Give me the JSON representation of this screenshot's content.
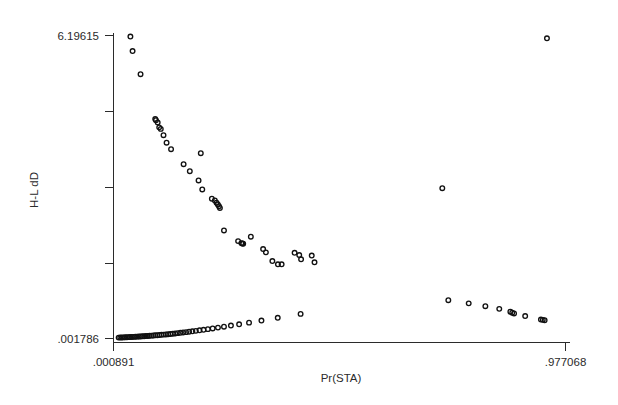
{
  "chart_data": {
    "type": "scatter",
    "title": "",
    "subtitle": "",
    "xlabel": "Pr(STA)",
    "ylabel": "H-L dD",
    "grid": false,
    "legend": false,
    "legend_position": "none",
    "marker_style": "open-circle",
    "marker_color": "#111111",
    "background_color": "#ffffff",
    "xlim": [
      0.000891,
      0.977068
    ],
    "ylim": [
      0.001786,
      6.19615
    ],
    "xticks": [
      0.000891,
      0.977068
    ],
    "xtick_labels": [
      ".000891",
      ".977068"
    ],
    "yticks": [
      0.001786,
      1.550627,
      3.099468,
      4.648309,
      6.19615
    ],
    "ytick_labels": [
      "",
      "",
      "",
      "",
      ""
    ],
    "ytick_labeled": {
      "top": "6.19615",
      "bottom": ".001786"
    },
    "n_points": 96,
    "series": [
      {
        "name": "H-L dD vs Pr(STA)",
        "points": [
          [
            0.0374,
            6.175
          ],
          [
            0.0421,
            5.878
          ],
          [
            0.0593,
            5.405
          ],
          [
            0.091,
            4.487
          ],
          [
            0.0926,
            4.466
          ],
          [
            0.0963,
            4.42
          ],
          [
            0.0996,
            4.318
          ],
          [
            0.103,
            4.287
          ],
          [
            0.1089,
            4.158
          ],
          [
            0.1155,
            4.005
          ],
          [
            0.1252,
            3.872
          ],
          [
            0.1523,
            3.565
          ],
          [
            0.1657,
            3.423
          ],
          [
            0.1894,
            3.79
          ],
          [
            0.1846,
            3.232
          ],
          [
            0.1926,
            3.048
          ],
          [
            0.2133,
            2.86
          ],
          [
            0.2198,
            2.824
          ],
          [
            0.2234,
            2.778
          ],
          [
            0.2262,
            2.742
          ],
          [
            0.2287,
            2.706
          ],
          [
            0.2307,
            2.67
          ],
          [
            0.2395,
            2.21
          ],
          [
            0.27,
            1.993
          ],
          [
            0.277,
            1.952
          ],
          [
            0.279,
            1.946
          ],
          [
            0.281,
            1.94
          ],
          [
            0.2975,
            2.083
          ],
          [
            0.324,
            1.83
          ],
          [
            0.33,
            1.763
          ],
          [
            0.344,
            1.585
          ],
          [
            0.356,
            1.519
          ],
          [
            0.364,
            1.519
          ],
          [
            0.392,
            1.753
          ],
          [
            0.402,
            1.707
          ],
          [
            0.406,
            1.62
          ],
          [
            0.429,
            1.697
          ],
          [
            0.435,
            1.56
          ],
          [
            0.711,
            3.074
          ],
          [
            0.937,
            6.139
          ],
          [
            0.012,
            0.02
          ],
          [
            0.0155,
            0.0215
          ],
          [
            0.019,
            0.023
          ],
          [
            0.0226,
            0.0245
          ],
          [
            0.0262,
            0.0262
          ],
          [
            0.0298,
            0.028
          ],
          [
            0.0334,
            0.0298
          ],
          [
            0.037,
            0.0316
          ],
          [
            0.0407,
            0.0336
          ],
          [
            0.0444,
            0.0356
          ],
          [
            0.0481,
            0.0377
          ],
          [
            0.0518,
            0.0398
          ],
          [
            0.0556,
            0.042
          ],
          [
            0.0594,
            0.0443
          ],
          [
            0.0632,
            0.0467
          ],
          [
            0.0671,
            0.0492
          ],
          [
            0.071,
            0.0518
          ],
          [
            0.075,
            0.0545
          ],
          [
            0.079,
            0.0573
          ],
          [
            0.0831,
            0.0602
          ],
          [
            0.0872,
            0.0633
          ],
          [
            0.0914,
            0.0665
          ],
          [
            0.0957,
            0.0699
          ],
          [
            0.1001,
            0.0735
          ],
          [
            0.1046,
            0.0773
          ],
          [
            0.1092,
            0.0813
          ],
          [
            0.1139,
            0.0856
          ],
          [
            0.1187,
            0.0901
          ],
          [
            0.1237,
            0.0949
          ],
          [
            0.1288,
            0.1001
          ],
          [
            0.1341,
            0.1056
          ],
          [
            0.1396,
            0.1115
          ],
          [
            0.1453,
            0.1178
          ],
          [
            0.1513,
            0.1246
          ],
          [
            0.1576,
            0.132
          ],
          [
            0.1642,
            0.14
          ],
          [
            0.1712,
            0.1487
          ],
          [
            0.1787,
            0.1582
          ],
          [
            0.1867,
            0.1687
          ],
          [
            0.1953,
            0.1803
          ],
          [
            0.2047,
            0.1932
          ],
          [
            0.215,
            0.2078
          ],
          [
            0.2265,
            0.2244
          ],
          [
            0.2395,
            0.2435
          ],
          [
            0.2545,
            0.266
          ],
          [
            0.2722,
            0.293
          ],
          [
            0.2936,
            0.3262
          ],
          [
            0.3204,
            0.3683
          ],
          [
            0.3556,
            0.4245
          ],
          [
            0.405,
            0.505
          ],
          [
            0.724,
            0.784
          ],
          [
            0.768,
            0.72
          ],
          [
            0.804,
            0.662
          ],
          [
            0.834,
            0.608
          ],
          [
            0.858,
            0.55
          ],
          [
            0.862,
            0.53
          ],
          [
            0.866,
            0.515
          ],
          [
            0.89,
            0.46
          ],
          [
            0.924,
            0.39
          ],
          [
            0.928,
            0.383
          ],
          [
            0.932,
            0.376
          ]
        ]
      }
    ]
  },
  "axes": {
    "y_top_label": "6.19615",
    "y_bottom_label": ".001786",
    "y_title": "H-L dD",
    "x_left_label": ".000891",
    "x_right_label": ".977068",
    "x_title": "Pr(STA)"
  }
}
